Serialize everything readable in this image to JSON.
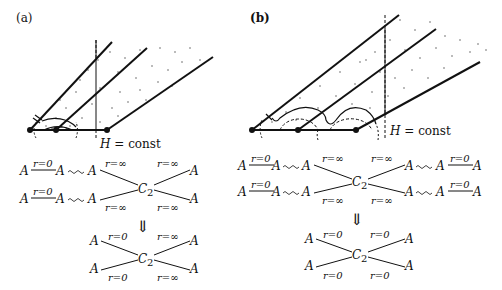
{
  "panels": [
    {
      "id": "a",
      "label": "(a)",
      "h_label": "H = const",
      "h_italic": "H",
      "h_rest": " = const",
      "top_rows": [
        {
          "left": [
            "A",
            "r=0",
            "A",
            "A",
            "r=∞"
          ],
          "right": [
            "r=∞",
            "A"
          ]
        },
        {
          "left": [
            "A",
            "r=0",
            "A",
            "A",
            "r=∞"
          ],
          "right": [
            "r=∞",
            "A"
          ]
        }
      ],
      "center": "C",
      "center_sub": "2",
      "arrow": "⇓",
      "result": {
        "tl": "r=0",
        "tr": "r=∞",
        "bl": "r=0",
        "br": "r=∞",
        "node": "A"
      }
    },
    {
      "id": "b",
      "label": "(b)",
      "h_label": "H = const",
      "h_italic": "H",
      "h_rest": " = const",
      "top_rows": [
        {
          "left": [
            "A",
            "r=0",
            "A",
            "A",
            "r=∞"
          ],
          "right": [
            "r=∞",
            "A",
            "A",
            "r=0",
            "A"
          ]
        },
        {
          "left": [
            "A",
            "r=0",
            "A",
            "A",
            "r=∞"
          ],
          "right": [
            "r=∞",
            "A",
            "A",
            "r=0",
            "A"
          ]
        }
      ],
      "center": "C",
      "center_sub": "2",
      "arrow": "⇓",
      "result": {
        "tl": "r=0",
        "tr": "r=0",
        "bl": "r=0",
        "br": "r=0",
        "node": "A"
      }
    }
  ],
  "colors": {
    "ink": "#111111",
    "background": "#ffffff"
  }
}
